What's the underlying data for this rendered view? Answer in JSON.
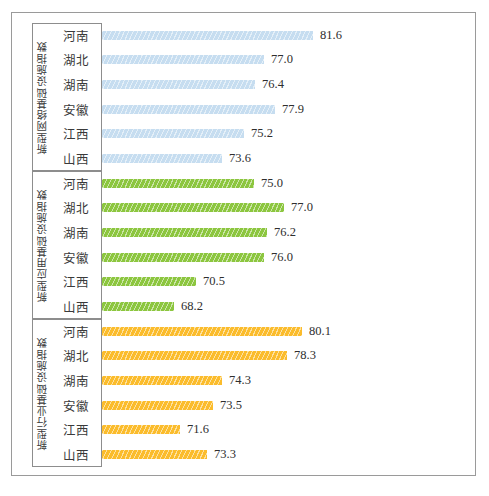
{
  "chart_data": {
    "type": "bar",
    "orientation": "horizontal",
    "title": "",
    "xlabel": "",
    "ylabel": "",
    "grid": false,
    "legend": false,
    "xlim": [
      0,
      100
    ],
    "categories": [
      "河南",
      "湖北",
      "湖南",
      "安徽",
      "江西",
      "山西"
    ],
    "groups": [
      {
        "name": "新型网络基础设施指数",
        "color": "#c6ddf0",
        "categories": [
          "河南",
          "湖北",
          "湖南",
          "安徽",
          "江西",
          "山西"
        ],
        "values": [
          81.6,
          77.0,
          76.4,
          77.9,
          75.2,
          73.6
        ],
        "value_labels": [
          "81.6",
          "77.0",
          "76.4",
          "77.9",
          "75.2",
          "73.6"
        ],
        "bar_pixel_lengths": [
          211,
          162,
          153,
          173,
          142,
          120
        ]
      },
      {
        "name": "新型应用基础设施指数",
        "color": "#8cc63f",
        "categories": [
          "河南",
          "湖北",
          "湖南",
          "安徽",
          "江西",
          "山西"
        ],
        "values": [
          75.0,
          77.0,
          76.2,
          76.0,
          70.5,
          68.2
        ],
        "value_labels": [
          "75.0",
          "77.0",
          "76.2",
          "76.0",
          "70.5",
          "68.2"
        ],
        "bar_pixel_lengths": [
          152,
          182,
          165,
          162,
          94,
          72
        ]
      },
      {
        "name": "新型行业基础设施指数",
        "color": "#fbbc2c",
        "categories": [
          "河南",
          "湖北",
          "湖南",
          "安徽",
          "江西",
          "山西"
        ],
        "values": [
          80.1,
          78.3,
          74.3,
          73.5,
          71.6,
          73.3
        ],
        "value_labels": [
          "80.1",
          "78.3",
          "74.3",
          "73.5",
          "71.6",
          "73.3"
        ],
        "bar_pixel_lengths": [
          200,
          185,
          120,
          111,
          78,
          105
        ]
      }
    ]
  },
  "colors": {
    "network_bar": "#c6ddf0",
    "application_bar": "#8cc63f",
    "industry_bar": "#fbbc2c",
    "frame_border": "#9a9a9a",
    "axis_border": "#8d8d8d",
    "text": "#2e2e2e"
  }
}
